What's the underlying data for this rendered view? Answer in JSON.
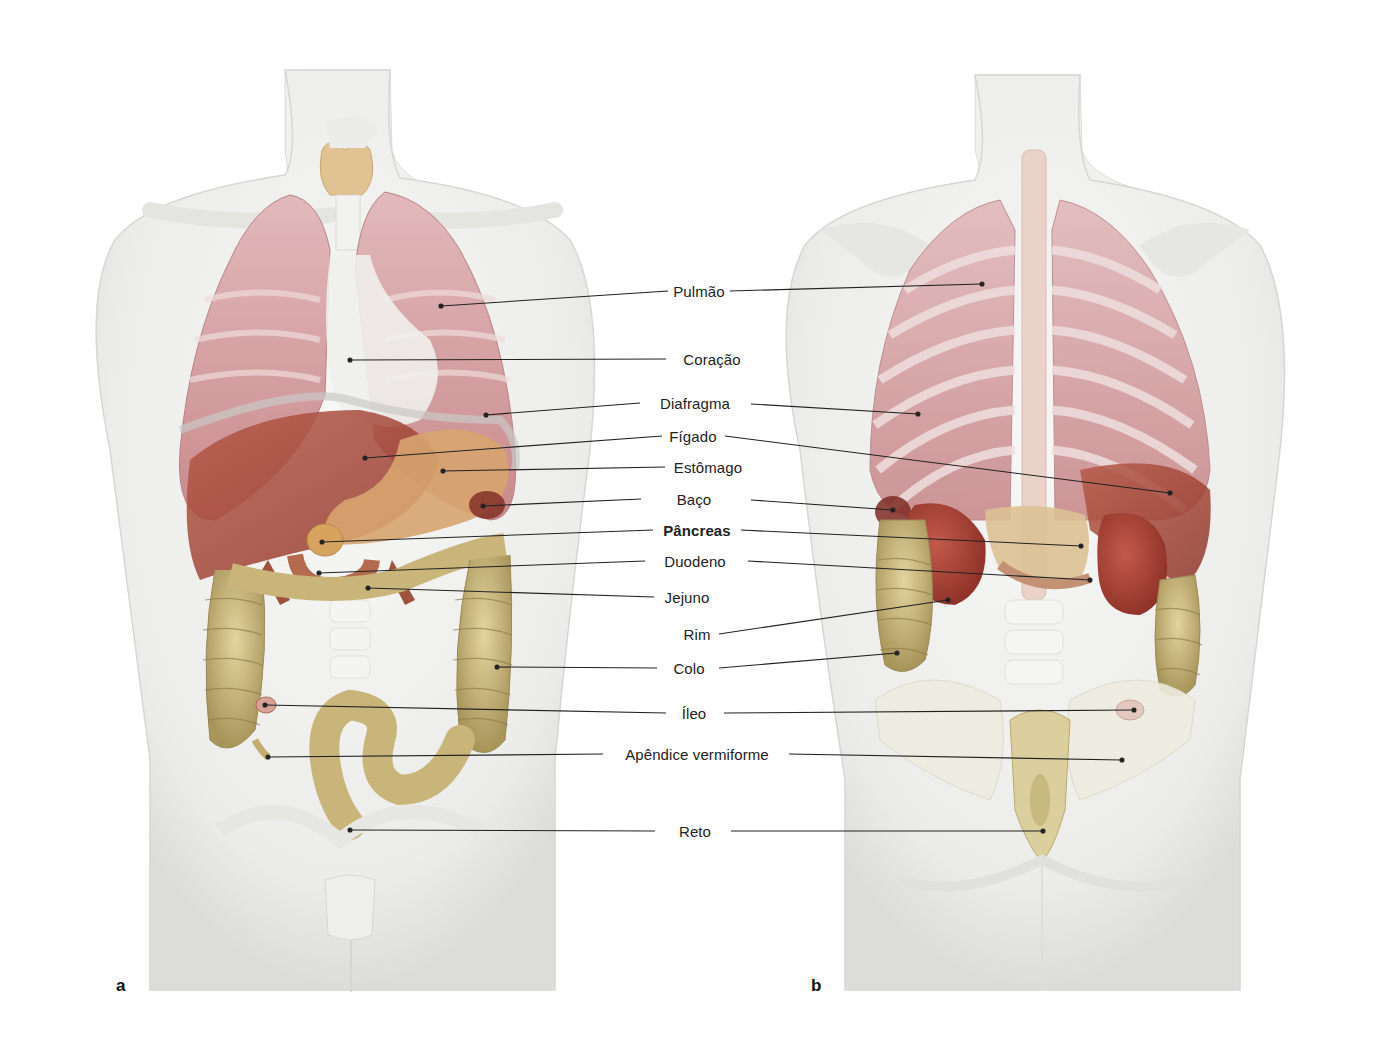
{
  "figure": {
    "panels": [
      {
        "letter": "a",
        "view": "anterior"
      },
      {
        "letter": "b",
        "view": "posterior"
      }
    ],
    "labels": [
      {
        "id": "pulmao",
        "text": "Pulmão",
        "x": 699,
        "y": 291,
        "bold": false
      },
      {
        "id": "coracao",
        "text": "Coração",
        "x": 712,
        "y": 359,
        "bold": false
      },
      {
        "id": "diafragma",
        "text": "Diafragma",
        "x": 695,
        "y": 403,
        "bold": false
      },
      {
        "id": "figado",
        "text": "Fígado",
        "x": 693,
        "y": 436,
        "bold": false
      },
      {
        "id": "estomago",
        "text": "Estômago",
        "x": 708,
        "y": 467,
        "bold": false
      },
      {
        "id": "baco",
        "text": "Baço",
        "x": 694,
        "y": 499,
        "bold": false
      },
      {
        "id": "pancreas",
        "text": "Pâncreas",
        "x": 697,
        "y": 530,
        "bold": true
      },
      {
        "id": "duodeno",
        "text": "Duodeno",
        "x": 695,
        "y": 561,
        "bold": false
      },
      {
        "id": "jejuno",
        "text": "Jejuno",
        "x": 687,
        "y": 597,
        "bold": false
      },
      {
        "id": "rim",
        "text": "Rim",
        "x": 697,
        "y": 634,
        "bold": false
      },
      {
        "id": "colo",
        "text": "Colo",
        "x": 689,
        "y": 668,
        "bold": false
      },
      {
        "id": "ileo",
        "text": "Íleo",
        "x": 694,
        "y": 713,
        "bold": false
      },
      {
        "id": "apendice",
        "text": "Apêndice vermiforme",
        "x": 697,
        "y": 754,
        "bold": false
      },
      {
        "id": "reto",
        "text": "Reto",
        "x": 695,
        "y": 831,
        "bold": false
      }
    ],
    "leaders": {
      "left": [
        {
          "label": "pulmao",
          "from": [
            441,
            306
          ],
          "to": [
            668,
            291
          ]
        },
        {
          "label": "coracao",
          "from": [
            350,
            360
          ],
          "to": [
            666,
            359
          ]
        },
        {
          "label": "diafragma",
          "from": [
            486,
            415
          ],
          "to": [
            640,
            403
          ]
        },
        {
          "label": "figado",
          "from": [
            365,
            458
          ],
          "to": [
            662,
            436
          ]
        },
        {
          "label": "estomago",
          "from": [
            443,
            471
          ],
          "to": [
            665,
            467
          ]
        },
        {
          "label": "baco",
          "from": [
            483,
            506
          ],
          "to": [
            641,
            499
          ]
        },
        {
          "label": "pancreas",
          "from": [
            322,
            542
          ],
          "to": [
            653,
            530
          ]
        },
        {
          "label": "duodeno",
          "from": [
            319,
            573
          ],
          "to": [
            645,
            561
          ]
        },
        {
          "label": "jejuno",
          "from": [
            368,
            588
          ],
          "to": [
            654,
            597
          ]
        },
        {
          "label": "colo",
          "from": [
            497,
            667
          ],
          "to": [
            657,
            668
          ]
        },
        {
          "label": "ileo",
          "from": [
            265,
            705
          ],
          "to": [
            666,
            713
          ]
        },
        {
          "label": "apendice",
          "from": [
            268,
            757
          ],
          "to": [
            603,
            754
          ]
        },
        {
          "label": "reto",
          "from": [
            350,
            830
          ],
          "to": [
            655,
            831
          ]
        }
      ],
      "right": [
        {
          "label": "pulmao",
          "from": [
            730,
            291
          ],
          "to": [
            982,
            284
          ]
        },
        {
          "label": "diafragma",
          "from": [
            751,
            404
          ],
          "to": [
            918,
            414
          ]
        },
        {
          "label": "figado",
          "from": [
            725,
            436
          ],
          "to": [
            1170,
            493
          ]
        },
        {
          "label": "baco",
          "from": [
            751,
            500
          ],
          "to": [
            893,
            510
          ]
        },
        {
          "label": "pancreas",
          "from": [
            741,
            530
          ],
          "to": [
            1081,
            546
          ]
        },
        {
          "label": "duodeno",
          "from": [
            748,
            561
          ],
          "to": [
            1090,
            580
          ]
        },
        {
          "label": "rim",
          "from": [
            719,
            634
          ],
          "to": [
            948,
            600
          ]
        },
        {
          "label": "colo",
          "from": [
            719,
            668
          ],
          "to": [
            897,
            653
          ]
        },
        {
          "label": "ileo",
          "from": [
            724,
            713
          ],
          "to": [
            1134,
            710
          ]
        },
        {
          "label": "apendice",
          "from": [
            789,
            754
          ],
          "to": [
            1122,
            760
          ]
        },
        {
          "label": "reto",
          "from": [
            731,
            831
          ],
          "to": [
            1043,
            831
          ]
        }
      ]
    },
    "colors": {
      "body": "#eeeeec",
      "body_edge": "#d8d8d4",
      "lung": "#d9a7a9",
      "liver": "#a8493a",
      "stomach": "#d9a873",
      "colon": "#c9b57a",
      "kidney": "#a23e33",
      "pancreas": "#d8b988",
      "thyroid": "#e2c596",
      "leader": "#222222",
      "text": "#222222"
    }
  }
}
